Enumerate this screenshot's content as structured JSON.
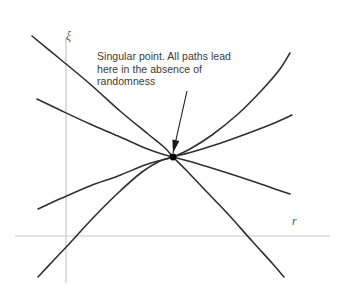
{
  "figure": {
    "width": 346,
    "height": 297,
    "background_color": "#ffffff",
    "title": ""
  },
  "axes": {
    "color": "#c8c8c8",
    "y_axis": {
      "label": "ξ",
      "x": 66,
      "y_top": 38,
      "y_bottom": 283
    },
    "x_axis": {
      "label": "r",
      "y": 236,
      "x_left": 15,
      "x_right": 330
    }
  },
  "annotation": {
    "text": "Singular point. All paths lead here in the absence of randomness",
    "lines": [
      "Singular point. All paths lead",
      "here in the absence of",
      "randomness"
    ],
    "color": "#3a3a3a",
    "arrow": {
      "from_x": 187,
      "from_y": 91,
      "to_x": 173,
      "to_y": 153,
      "color": "#1a1a1a"
    }
  },
  "singular_point": {
    "x": 173,
    "y": 157,
    "radius": 3.4,
    "color": "#000000"
  },
  "chart_data": {
    "type": "line",
    "title": "",
    "xlabel": "r",
    "ylabel": "ξ",
    "grid": false,
    "legend": null,
    "annotations": [
      {
        "text": "Singular point. All paths lead here in the absence of randomness",
        "target_x": 173,
        "target_y": 157
      }
    ],
    "curve_color": "#303030",
    "curve_width": 1.6,
    "series": [
      {
        "name": "upper-left-to-lower-right-steep",
        "points": [
          [
            32,
            36
          ],
          [
            60,
            59
          ],
          [
            90,
            84
          ],
          [
            120,
            111
          ],
          [
            148,
            134
          ],
          [
            165,
            148
          ],
          [
            173,
            157
          ],
          [
            186,
            170
          ],
          [
            205,
            190
          ],
          [
            228,
            214
          ],
          [
            252,
            241
          ],
          [
            272,
            263
          ],
          [
            284,
            277
          ]
        ]
      },
      {
        "name": "lower-left-to-upper-right-steep",
        "points": [
          [
            38,
            277
          ],
          [
            52,
            262
          ],
          [
            70,
            243
          ],
          [
            92,
            219
          ],
          [
            118,
            193
          ],
          [
            142,
            172
          ],
          [
            160,
            161
          ],
          [
            173,
            157
          ],
          [
            190,
            149
          ],
          [
            212,
            135
          ],
          [
            238,
            114
          ],
          [
            262,
            90
          ],
          [
            280,
            69
          ],
          [
            290,
            53
          ]
        ]
      },
      {
        "name": "upper-left-shallow-to-lower-right",
        "points": [
          [
            37,
            99
          ],
          [
            62,
            111
          ],
          [
            90,
            124
          ],
          [
            118,
            136
          ],
          [
            145,
            148
          ],
          [
            162,
            154
          ],
          [
            173,
            157
          ],
          [
            192,
            162
          ],
          [
            218,
            170
          ],
          [
            246,
            179
          ],
          [
            272,
            188
          ],
          [
            290,
            194
          ]
        ]
      },
      {
        "name": "lower-left-shallow-to-upper-right",
        "points": [
          [
            38,
            209
          ],
          [
            62,
            198
          ],
          [
            90,
            186
          ],
          [
            118,
            176
          ],
          [
            145,
            165
          ],
          [
            162,
            160
          ],
          [
            173,
            157
          ],
          [
            192,
            152
          ],
          [
            218,
            144
          ],
          [
            246,
            134
          ],
          [
            272,
            124
          ],
          [
            292,
            115
          ]
        ]
      }
    ]
  }
}
